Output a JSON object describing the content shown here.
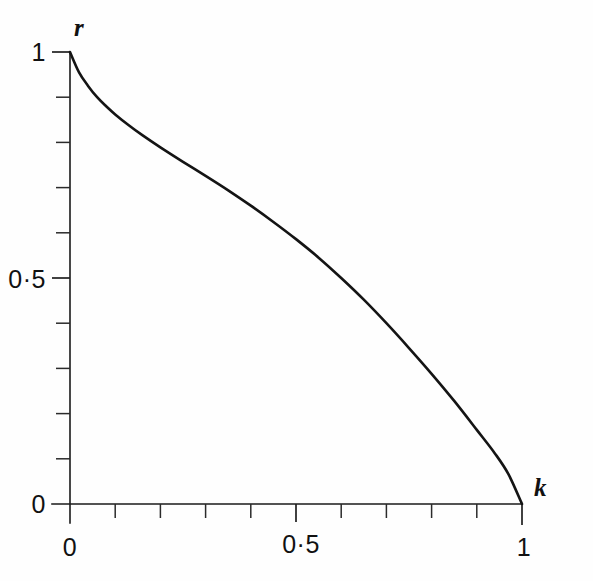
{
  "chart_data": {
    "type": "line",
    "title": "",
    "subtitle": "",
    "xlabel": "k",
    "ylabel": "r",
    "xlim": [
      0,
      1
    ],
    "ylim": [
      0,
      1
    ],
    "grid": false,
    "legend": null,
    "annotations": [],
    "x_tick_labels": [
      "0",
      "0·5",
      "1"
    ],
    "y_tick_labels": [
      "0",
      "0·5",
      "1"
    ],
    "x_tick_values": [
      0,
      0.5,
      1
    ],
    "y_tick_values": [
      0,
      0.5,
      1
    ],
    "x_minor_tick_values": [
      0.1,
      0.2,
      0.3,
      0.4,
      0.6,
      0.7,
      0.8,
      0.9
    ],
    "y_minor_tick_values": [
      0.1,
      0.2,
      0.3,
      0.4,
      0.6,
      0.7,
      0.8,
      0.9
    ],
    "line_color": "#141414",
    "axis_color": "#1a1a1a",
    "background_color": "#fefefe",
    "series": [
      {
        "name": "r(k)",
        "x": [
          0.0,
          0.02,
          0.04,
          0.06,
          0.08,
          0.1,
          0.13,
          0.16,
          0.2,
          0.25,
          0.3,
          0.35,
          0.4,
          0.45,
          0.5,
          0.55,
          0.6,
          0.65,
          0.7,
          0.75,
          0.8,
          0.85,
          0.9,
          0.94,
          0.97,
          1.0
        ],
        "y": [
          1.0,
          0.955,
          0.925,
          0.9,
          0.88,
          0.862,
          0.838,
          0.816,
          0.789,
          0.757,
          0.726,
          0.694,
          0.66,
          0.624,
          0.586,
          0.545,
          0.5,
          0.452,
          0.4,
          0.345,
          0.288,
          0.228,
          0.164,
          0.112,
          0.066,
          0.0
        ]
      }
    ]
  },
  "axis_labels": {
    "x_axis_name": "k",
    "y_axis_name": "r"
  },
  "tick_text": {
    "x_zero": "0",
    "x_half": "0·5",
    "x_one": "1",
    "y_zero": "0",
    "y_half": "0·5",
    "y_one": "1"
  }
}
